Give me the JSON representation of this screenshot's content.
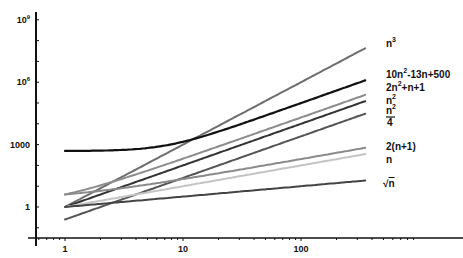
{
  "chart_data": {
    "type": "line",
    "title": "",
    "xlabel": "n",
    "ylabel": "",
    "xscale": "log",
    "yscale": "log",
    "xlim": [
      0.6,
      600
    ],
    "ylim": [
      0.03,
      2000000000
    ],
    "grid": false,
    "legend_position": "inline-right",
    "x_ticks": [
      {
        "value": 1,
        "label": "1"
      },
      {
        "value": 10,
        "label": "10"
      },
      {
        "value": 100,
        "label": "100"
      }
    ],
    "y_ticks": [
      {
        "value": 1,
        "label": "1"
      },
      {
        "value": 1000,
        "label": "1000"
      },
      {
        "value": 1000000,
        "label": "10^6",
        "base": "10",
        "exp": "6"
      },
      {
        "value": 1000000000,
        "label": "10^9",
        "base": "10",
        "exp": "9"
      }
    ],
    "x_range": [
      1,
      350
    ],
    "series": [
      {
        "name": "n^3",
        "expr": "n3",
        "color": "#6e6e6e",
        "width": 2.0,
        "label_y": 44
      },
      {
        "name": "10n^2-13n+500",
        "expr": "10n2m13n500",
        "color": "#111111",
        "width": 2.2,
        "label_y": 74
      },
      {
        "name": "2n^2+n+1",
        "expr": "2n2n1",
        "color": "#8c8c8c",
        "width": 2.0,
        "label_y": 87
      },
      {
        "name": "n^2",
        "expr": "n2",
        "color": "#333333",
        "width": 2.0,
        "label_y": 100
      },
      {
        "name": "n^2/4",
        "expr": "n2d4",
        "color": "#555555",
        "width": 2.0,
        "label_y": 113
      },
      {
        "name": "2(n+1)",
        "expr": "2n1",
        "color": "#8a8a8a",
        "width": 2.0,
        "label_y": 147
      },
      {
        "name": "n",
        "expr": "n",
        "color": "#c4c4c4",
        "width": 2.0,
        "label_y": 160
      },
      {
        "name": "sqrt(n)",
        "expr": "sqrtn",
        "color": "#444444",
        "width": 2.0,
        "label_y": 184
      }
    ]
  },
  "labels": {
    "n3": {
      "base": "n",
      "sup": "3"
    },
    "quad10": {
      "a": "10n",
      "sup": "2",
      "b": "-13n+500"
    },
    "quad2": {
      "a": "2n",
      "sup": "2",
      "b": "+n+1"
    },
    "sq": {
      "base": "n",
      "sup": "2"
    },
    "sq4": {
      "num": "n",
      "sup": "2",
      "den": "4"
    },
    "lin2": "2(n+1)",
    "lin": "n",
    "root": "n",
    "root_sign": "√"
  }
}
